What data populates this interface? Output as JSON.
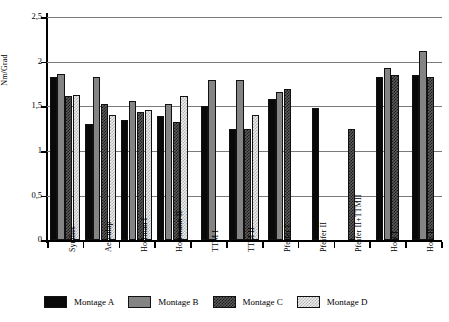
{
  "chart_data": {
    "type": "bar",
    "title": "",
    "subtitle": "",
    "xlabel": "",
    "ylabel": "Nm/Grad",
    "ylim": [
      0,
      2.5
    ],
    "grid": true,
    "legend_position": "bottom",
    "ytick_labels": [
      "0",
      "0,5",
      "1",
      "1,5",
      "2",
      "2,5"
    ],
    "ytick_values": [
      0,
      0.5,
      1,
      1.5,
      2,
      2.5
    ],
    "categories": [
      "Synthes",
      "Aesculap",
      "Hoffman I",
      "Hoffmann II",
      "TTM I",
      "TTM II",
      "Pfeifer I",
      "Pfeifer II",
      "Pfeifer II+TTMII",
      "Holz I",
      "Holz II"
    ],
    "series": [
      {
        "name": "Montage A",
        "color": "#090909",
        "pattern": "solid-black",
        "values": [
          1.83,
          1.3,
          1.35,
          1.39,
          1.5,
          1.25,
          1.58,
          1.48,
          null,
          1.83,
          1.85
        ]
      },
      {
        "name": "Montage B",
        "color": "#848484",
        "pattern": "solid-gray",
        "values": [
          1.86,
          1.83,
          1.56,
          1.53,
          1.8,
          1.8,
          1.66,
          null,
          null,
          1.93,
          2.12
        ]
      },
      {
        "name": "Montage C",
        "color": "#5c5c5c",
        "pattern": "dark-checker",
        "values": [
          1.62,
          1.53,
          1.44,
          1.33,
          null,
          1.25,
          1.69,
          null,
          1.25,
          1.85,
          1.83
        ]
      },
      {
        "name": "Montage D",
        "color": "#ececec",
        "pattern": "light-checker",
        "values": [
          1.63,
          1.4,
          1.46,
          1.62,
          null,
          1.4,
          null,
          null,
          null,
          null,
          null
        ]
      }
    ]
  },
  "legend": {
    "items": [
      {
        "label": "Montage A",
        "swatch": "swatch-montage-a"
      },
      {
        "label": "Montage B",
        "swatch": "swatch-montage-b"
      },
      {
        "label": "Montage C",
        "swatch": "swatch-montage-c"
      },
      {
        "label": "Montage D",
        "swatch": "swatch-montage-d"
      }
    ]
  }
}
